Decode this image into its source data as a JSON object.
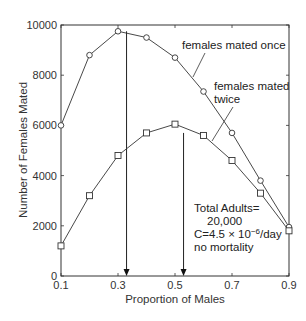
{
  "chart_data": {
    "type": "line",
    "title": "",
    "xlabel": "Proportion of Males",
    "ylabel": "Number of Females Mated",
    "xlim": [
      0.1,
      0.9
    ],
    "ylim": [
      0,
      10000
    ],
    "x_ticks": [
      0.1,
      0.3,
      0.5,
      0.7,
      0.9
    ],
    "x_tick_labels": [
      "0.1",
      "0.3",
      "0.5",
      "0.7",
      "0.9"
    ],
    "y_ticks": [
      0,
      2000,
      4000,
      6000,
      8000,
      10000
    ],
    "y_tick_labels": [
      "0",
      "2000",
      "4000",
      "6000",
      "8000",
      "10000"
    ],
    "grid": false,
    "x": [
      0.1,
      0.2,
      0.3,
      0.4,
      0.5,
      0.6,
      0.7,
      0.8,
      0.9
    ],
    "series": [
      {
        "name": "females mated once",
        "marker": "circle",
        "values": [
          6000,
          8800,
          9750,
          9500,
          8700,
          7350,
          5700,
          3800,
          1950
        ]
      },
      {
        "name": "females mated twice",
        "marker": "square",
        "values": [
          1200,
          3200,
          4800,
          5700,
          6050,
          5600,
          4600,
          3300,
          1800
        ]
      }
    ],
    "arrows": [
      {
        "x": 0.33,
        "from_y": 9750,
        "to_y": 0,
        "label": "optimum for females mated once"
      },
      {
        "x": 0.53,
        "from_y": 5700,
        "to_y": 0,
        "label": "optimum for females mated twice"
      }
    ],
    "annotations": {
      "series_labels": [
        {
          "text": "females mated once"
        },
        {
          "text": "females mated",
          "text2": "twice"
        }
      ],
      "conditions": [
        "Total Adults=",
        "20,000",
        "C=4.5 × 10",
        "−6",
        "/day",
        "no mortality"
      ]
    }
  }
}
